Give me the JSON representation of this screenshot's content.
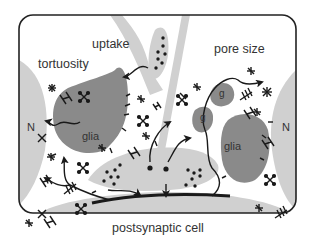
{
  "diagram": {
    "labels": {
      "uptake": "uptake",
      "tortuosity": "tortuosity",
      "pore_size": "pore size",
      "glia_left": "glia",
      "glia_right": "glia",
      "g_top": "g",
      "g_mid": "g",
      "nucleus_left": "N",
      "nucleus_right": "N",
      "postsynaptic": "postsynaptic cell"
    },
    "colors": {
      "frame": "#222222",
      "background": "#ffffff",
      "neuron_light": "#d0d0d0",
      "glia_dark": "#8a8a8a",
      "ink": "#1a1a1a"
    }
  }
}
